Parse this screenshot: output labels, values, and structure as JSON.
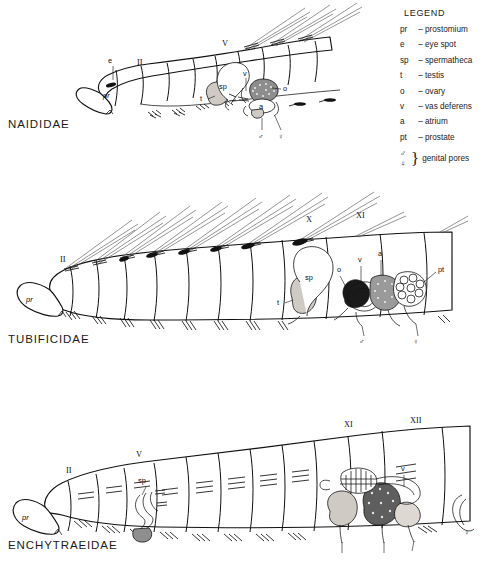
{
  "legend": {
    "title": "LEGEND",
    "entries": [
      {
        "abbr": "pr",
        "dash": "–",
        "term": "prostomium"
      },
      {
        "abbr": "e",
        "dash": "–",
        "term": "eye spot"
      },
      {
        "abbr": "sp",
        "dash": "–",
        "term": "spermatheca"
      },
      {
        "abbr": "t",
        "dash": "–",
        "term": "testis"
      },
      {
        "abbr": "o",
        "dash": "–",
        "term": "ovary"
      },
      {
        "abbr": "v",
        "dash": "–",
        "term": "vas deferens"
      },
      {
        "abbr": "a",
        "dash": "–",
        "term": "atrium"
      },
      {
        "abbr": "pt",
        "dash": "–",
        "term": "prostate"
      }
    ],
    "pores": {
      "male_symbol": "♂",
      "female_symbol": "♀",
      "term": "genital pores"
    }
  },
  "diagrams": {
    "naididae": {
      "family": "NAIDIDAE",
      "segments": [
        "II",
        "V"
      ],
      "labels": {
        "prostomium": "pr",
        "eye": "e",
        "spermatheca": "sp",
        "testis": "t",
        "vas_deferens": "v",
        "ovary": "o",
        "atrium": "a",
        "male_pore": "♂",
        "female_pore": "♀"
      }
    },
    "tubificidae": {
      "family": "TUBIFICIDAE",
      "segments": [
        "II",
        "X",
        "XI"
      ],
      "labels": {
        "prostomium": "pr",
        "spermatheca": "sp",
        "testis": "t",
        "ovary": "o",
        "vas_deferens": "v",
        "atrium": "a",
        "prostate": "pt",
        "male_pore": "♂",
        "female_pore": "♀"
      }
    },
    "enchytraeidae": {
      "family": "ENCHYTRAEIDAE",
      "segments": [
        "II",
        "V",
        "XI",
        "XII"
      ],
      "labels": {
        "prostomium": "pr",
        "spermatheca": "sp",
        "vas_deferens": "v",
        "testis": "t",
        "ovary": "o",
        "male_pore": "♂",
        "female_pore": "♀"
      }
    }
  }
}
